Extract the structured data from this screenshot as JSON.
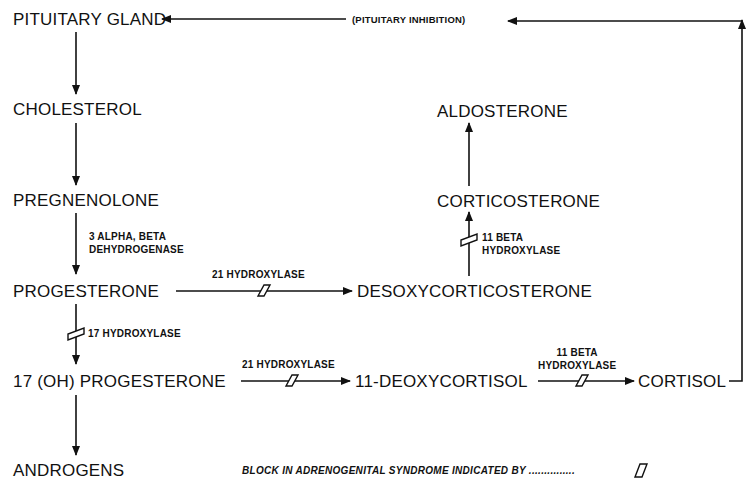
{
  "diagram": {
    "nodes": {
      "pituitary_gland": "PITUITARY GLAND",
      "cholesterol": "CHOLESTEROL",
      "pregnenolone": "PREGNENOLONE",
      "progesterone": "PROGESTERONE",
      "oh17_progesterone": "17 (OH) PROGESTERONE",
      "androgens": "ANDROGENS",
      "desoxycorticosterone": "DESOXYCORTICOSTERONE",
      "corticosterone": "CORTICOSTERONE",
      "aldosterone": "ALDOSTERONE",
      "deoxycortisol_11": "11-DEOXYCORTISOL",
      "cortisol": "CORTISOL"
    },
    "enzymes": {
      "dehydrogenase_line1": "3 ALPHA, BETA",
      "dehydrogenase_line2": "DEHYDROGENASE",
      "hydroxylase_21_a": "21 HYDROXYLASE",
      "hydroxylase_21_b": "21 HYDROXYLASE",
      "hydroxylase_17": "17 HYDROXYLASE",
      "beta11_a_line1": "11 BETA",
      "beta11_a_line2": "HYDROXYLASE",
      "beta11_b_line1": "11 BETA",
      "beta11_b_line2": "HYDROXYLASE"
    },
    "feedback_label": "(PITUITARY INHIBITION)",
    "legend": {
      "text": "BLOCK IN ADRENOGENITAL SYNDROME INDICATED BY ...............",
      "symbol": "block-symbol"
    },
    "edges": [
      {
        "from": "pituitary_gland",
        "to": "cholesterol",
        "blocked": false
      },
      {
        "from": "cholesterol",
        "to": "pregnenolone",
        "blocked": false
      },
      {
        "from": "pregnenolone",
        "to": "progesterone",
        "enzyme": "3 ALPHA, BETA DEHYDROGENASE",
        "blocked": false
      },
      {
        "from": "progesterone",
        "to": "desoxycorticosterone",
        "enzyme": "21 HYDROXYLASE",
        "blocked": true
      },
      {
        "from": "desoxycorticosterone",
        "to": "corticosterone",
        "enzyme": "11 BETA HYDROXYLASE",
        "blocked": true
      },
      {
        "from": "corticosterone",
        "to": "aldosterone",
        "blocked": false
      },
      {
        "from": "progesterone",
        "to": "17 (OH) PROGESTERONE",
        "enzyme": "17 HYDROXYLASE",
        "blocked": true
      },
      {
        "from": "17 (OH) PROGESTERONE",
        "to": "11-DEOXYCORTISOL",
        "enzyme": "21 HYDROXYLASE",
        "blocked": true
      },
      {
        "from": "11-DEOXYCORTISOL",
        "to": "cortisol",
        "enzyme": "11 BETA HYDROXYLASE",
        "blocked": true
      },
      {
        "from": "17 (OH) PROGESTERONE",
        "to": "androgens",
        "blocked": false
      },
      {
        "from": "cortisol",
        "to": "pituitary_gland",
        "label": "(PITUITARY INHIBITION)",
        "blocked": false
      }
    ],
    "colors": {
      "ink": "#111111",
      "background": "#ffffff"
    }
  }
}
